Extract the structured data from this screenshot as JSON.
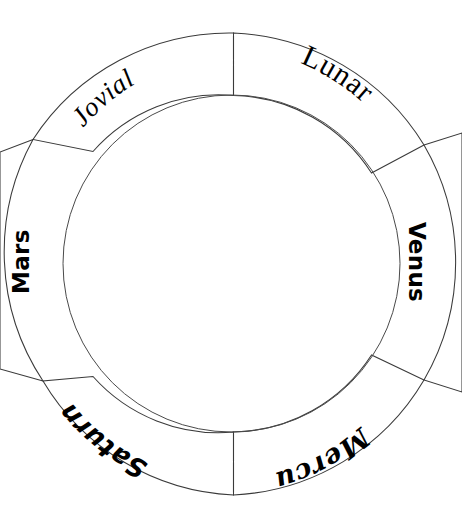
{
  "diagram": {
    "name": "segmented-ring-wheel",
    "type": "cycle-wheel",
    "background_color": "#ffffff",
    "stroke_color": "#3a3a3a",
    "center": {
      "x": 231,
      "y": 264
    },
    "inner_radius": 168,
    "outer_radius": 234,
    "segment_count": 6,
    "segments": [
      {
        "id": "jovial",
        "label": "Jovial",
        "text_style": "italic-serif",
        "color": "#000000",
        "start_angle": -140,
        "end_angle": -92,
        "label_angle": -122,
        "label_radius": 213
      },
      {
        "id": "lunar",
        "label": "Lunar",
        "text_style": "serif",
        "color": "#000000",
        "start_angle": -90,
        "end_angle": -40,
        "label_angle": -60,
        "label_radius": 216
      },
      {
        "id": "venus",
        "label": "Venus",
        "text_style": "bold-sans-vertical",
        "color": "#000000",
        "start_angle": -38,
        "end_angle": 30,
        "label_angle": 0,
        "label_radius": 212
      },
      {
        "id": "mercury",
        "label": "Mercury",
        "text_style": "script-serif",
        "color": "#000000",
        "start_angle": 32,
        "end_angle": 88,
        "label_angle": 58,
        "label_radius": 210
      },
      {
        "id": "saturn",
        "label": "Saturn",
        "text_style": "bold-italic-sans",
        "color": "#000000",
        "start_angle": 92,
        "end_angle": 140,
        "label_angle": 120,
        "label_radius": 210
      },
      {
        "id": "mars",
        "label": "Mars",
        "text_style": "bold-sans-vertical",
        "color": "#000000",
        "start_angle": 142,
        "end_angle": 218,
        "label_angle": 180,
        "label_radius": 212
      }
    ]
  }
}
